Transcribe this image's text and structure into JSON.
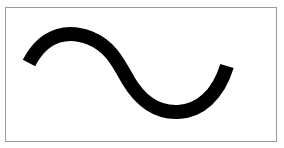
{
  "figure": {
    "frame_color": "#9a9a9a",
    "stroke_color": "#000000",
    "stroke_width": 14,
    "curve": {
      "start": [
        29,
        62
      ],
      "peak": [
        75,
        33
      ],
      "midpoint": [
        122,
        72
      ],
      "trough": [
        174,
        111
      ],
      "end": [
        227,
        67
      ]
    }
  }
}
